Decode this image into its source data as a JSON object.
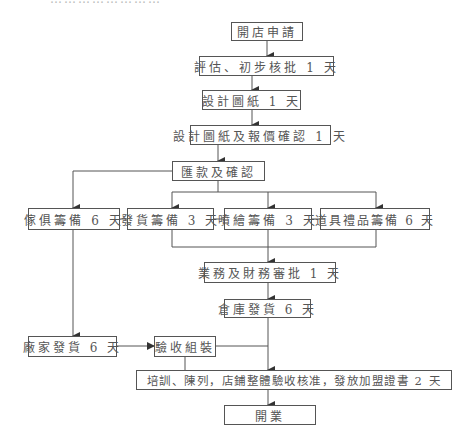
{
  "header": {
    "clipped_text": "……………………"
  },
  "flow": {
    "steps": {
      "open_application": "開店申請",
      "evaluation": "評估、初步核批 1 天",
      "design_drawing": "設計圖紙 1 天",
      "design_quote_confirm": "設計圖紙及報價確認 1 天",
      "payment_confirm": "匯款及確認",
      "furniture_prep": "傢俱籌備 6 天",
      "shipping_prep": "發貨籌備 3 天",
      "inkjet_prep": "噴繪籌備 3 天",
      "props_gifts_prep": "道具禮品籌備 6 天",
      "business_finance_approval": "業務及財務審批 1 天",
      "warehouse_shipping": "倉庫發貨 6 天",
      "factory_shipping": "廠家發貨 6 天",
      "acceptance_assembly": "驗收組裝",
      "training_final": "培訓、陳列，店鋪整體驗收核准，發放加盟證書 2 天",
      "opening": "開業"
    },
    "line_color": "#555555"
  }
}
